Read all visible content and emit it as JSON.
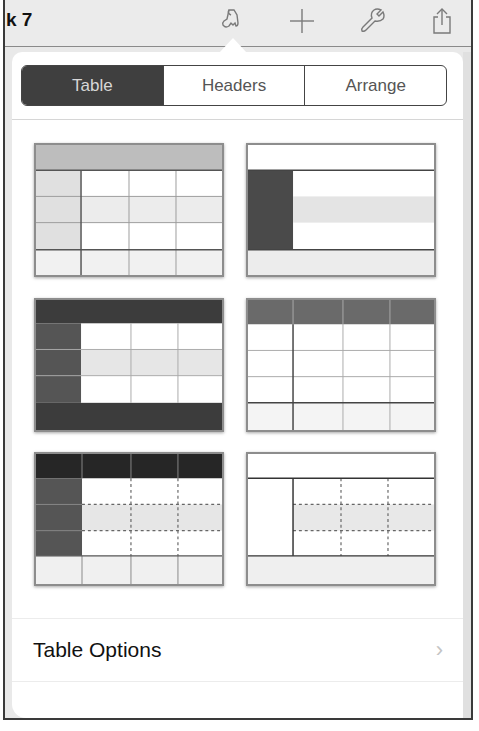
{
  "toolbar": {
    "title": "k 7",
    "icons": [
      {
        "name": "paintbrush-icon",
        "label": "Format"
      },
      {
        "name": "plus-icon",
        "label": "Insert"
      },
      {
        "name": "wrench-icon",
        "label": "Tools"
      },
      {
        "name": "share-icon",
        "label": "Share"
      }
    ]
  },
  "popover": {
    "tabs": [
      {
        "label": "Table",
        "active": true
      },
      {
        "label": "Headers",
        "active": false
      },
      {
        "label": "Arrange",
        "active": false
      }
    ],
    "table_styles": [
      {
        "id": "style-1",
        "description": "Light gray header row and header column, banded rows, footer row"
      },
      {
        "id": "style-2",
        "description": "White header row, dark header column, banded rows, gray footer"
      },
      {
        "id": "style-3",
        "description": "Dark header row, dark header column, banded rows, dark footer"
      },
      {
        "id": "style-4",
        "description": "Dark header row with column dividers, white grid, footer row"
      },
      {
        "id": "style-5",
        "description": "Black header row, dark header column, dotted grid lines, footer"
      },
      {
        "id": "style-6",
        "description": "White header row, header column, dotted grid lines, gray footer"
      }
    ],
    "table_options": {
      "label": "Table Options",
      "chevron": "›"
    }
  },
  "colors": {
    "segment_active_bg": "#3f3f3f",
    "segment_active_text": "#d7d7d7",
    "segment_text": "#555555",
    "toolbar_bg": "#ebebeb",
    "popover_bg": "#ffffff"
  }
}
